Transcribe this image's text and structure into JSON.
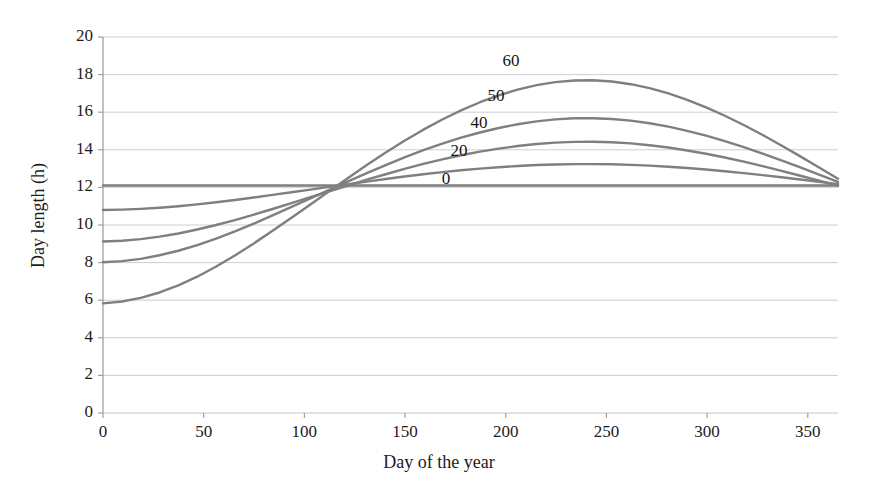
{
  "chart_data": {
    "type": "line",
    "title": "",
    "xlabel": "Day of the year",
    "ylabel": "Day length (h)",
    "xlim": [
      0,
      365
    ],
    "ylim": [
      0,
      20
    ],
    "xticks": [
      0,
      50,
      100,
      150,
      200,
      250,
      300,
      350
    ],
    "yticks": [
      0,
      2,
      4,
      6,
      8,
      10,
      12,
      14,
      16,
      18,
      20
    ],
    "grid": "horizontal",
    "legend": "inline-annotations",
    "legend_units": "degrees latitude",
    "line_color": "#7f7f7f",
    "gridline_color": "#c8c8c8",
    "axis_color": "#9a9a9a",
    "background": "#ffffff",
    "series": [
      {
        "name": "60",
        "label": "60",
        "label_x": 511,
        "label_y": 62,
        "latitude_deg": 60,
        "amplitude": 6.35,
        "mean": 12.1,
        "values": [
          5.83,
          5.93,
          6.12,
          6.41,
          6.79,
          7.25,
          7.79,
          8.38,
          9.02,
          9.69,
          10.39,
          11.09,
          11.8,
          12.5,
          13.19,
          13.85,
          14.48,
          15.07,
          15.61,
          16.1,
          16.53,
          16.9,
          17.2,
          17.44,
          17.6,
          17.69,
          17.7,
          17.63,
          17.49,
          17.28,
          17.0,
          16.66,
          16.26,
          15.81,
          15.32,
          14.79,
          14.23,
          13.65,
          13.06,
          12.46
        ]
      },
      {
        "name": "50",
        "label": "50",
        "label_x": 496,
        "label_y": 97,
        "latitude_deg": 50,
        "amplitude": 4.1,
        "mean": 12.1,
        "values": [
          8.02,
          8.08,
          8.2,
          8.39,
          8.63,
          8.93,
          9.28,
          9.66,
          10.07,
          10.51,
          10.96,
          11.41,
          11.87,
          12.32,
          12.76,
          13.19,
          13.6,
          13.98,
          14.33,
          14.65,
          14.92,
          15.16,
          15.36,
          15.51,
          15.62,
          15.68,
          15.68,
          15.64,
          15.55,
          15.41,
          15.23,
          15.01,
          14.75,
          14.46,
          14.14,
          13.8,
          13.44,
          13.06,
          12.68,
          12.29
        ]
      },
      {
        "name": "40",
        "label": "40",
        "label_x": 479,
        "label_y": 124,
        "latitude_deg": 40,
        "amplitude": 2.85,
        "mean": 12.1,
        "values": [
          9.12,
          9.16,
          9.25,
          9.38,
          9.55,
          9.76,
          10.0,
          10.26,
          10.55,
          10.85,
          11.16,
          11.48,
          11.79,
          12.1,
          12.41,
          12.7,
          12.99,
          13.25,
          13.49,
          13.71,
          13.9,
          14.06,
          14.2,
          14.31,
          14.38,
          14.42,
          14.43,
          14.4,
          14.34,
          14.24,
          14.12,
          13.96,
          13.79,
          13.59,
          13.37,
          13.13,
          12.88,
          12.62,
          12.36,
          12.09
        ]
      },
      {
        "name": "20",
        "label": "20",
        "label_x": 459,
        "label_y": 152,
        "latitude_deg": 20,
        "amplitude": 1.3,
        "mean": 12.1,
        "values": [
          10.8,
          10.82,
          10.86,
          10.92,
          11.0,
          11.1,
          11.21,
          11.33,
          11.46,
          11.6,
          11.74,
          11.88,
          12.03,
          12.17,
          12.31,
          12.45,
          12.58,
          12.7,
          12.81,
          12.91,
          13.0,
          13.07,
          13.14,
          13.19,
          13.22,
          13.24,
          13.24,
          13.23,
          13.2,
          13.16,
          13.1,
          13.03,
          12.95,
          12.86,
          12.76,
          12.65,
          12.54,
          12.42,
          12.3,
          12.17
        ]
      },
      {
        "name": "0",
        "label": "0",
        "label_x": 446,
        "label_y": 180,
        "latitude_deg": 0,
        "amplitude": 0.0,
        "mean": 12.1,
        "values": [
          12.1,
          12.1,
          12.1,
          12.1,
          12.1,
          12.1,
          12.1,
          12.1,
          12.1,
          12.1,
          12.1,
          12.1,
          12.1,
          12.1,
          12.1,
          12.1,
          12.1,
          12.1,
          12.1,
          12.1,
          12.1,
          12.1,
          12.1,
          12.1,
          12.1,
          12.1,
          12.1,
          12.1,
          12.1,
          12.1,
          12.1,
          12.1,
          12.1,
          12.1,
          12.1,
          12.1,
          12.1,
          12.1,
          12.1,
          12.1
        ]
      }
    ],
    "x": [
      0,
      9.4,
      18.7,
      28.1,
      37.4,
      46.8,
      56.2,
      65.5,
      74.9,
      84.2,
      93.6,
      103,
      112.3,
      121.7,
      131,
      140.4,
      149.7,
      159.1,
      168.5,
      177.8,
      187.2,
      196.5,
      205.9,
      215.3,
      224.6,
      234,
      243.3,
      252.7,
      262.1,
      271.4,
      280.8,
      290.1,
      299.5,
      308.8,
      318.2,
      327.6,
      336.9,
      346.3,
      355.6,
      365
    ],
    "notes": {
      "equinox_crossings_day": [
        81,
        266
      ],
      "summer_solstice_day": 172,
      "peak_value_60": 18.45,
      "min_value_60": 5.75
    }
  },
  "axes": {
    "y_tick_labels": [
      "20",
      "18",
      "16",
      "14",
      "12",
      "10",
      "8",
      "6",
      "4",
      "2",
      "0"
    ],
    "x_tick_labels": [
      "0",
      "50",
      "100",
      "150",
      "200",
      "250",
      "300",
      "350"
    ],
    "x_axis_title": "Day of the year",
    "y_axis_title": "Day length (h)"
  }
}
